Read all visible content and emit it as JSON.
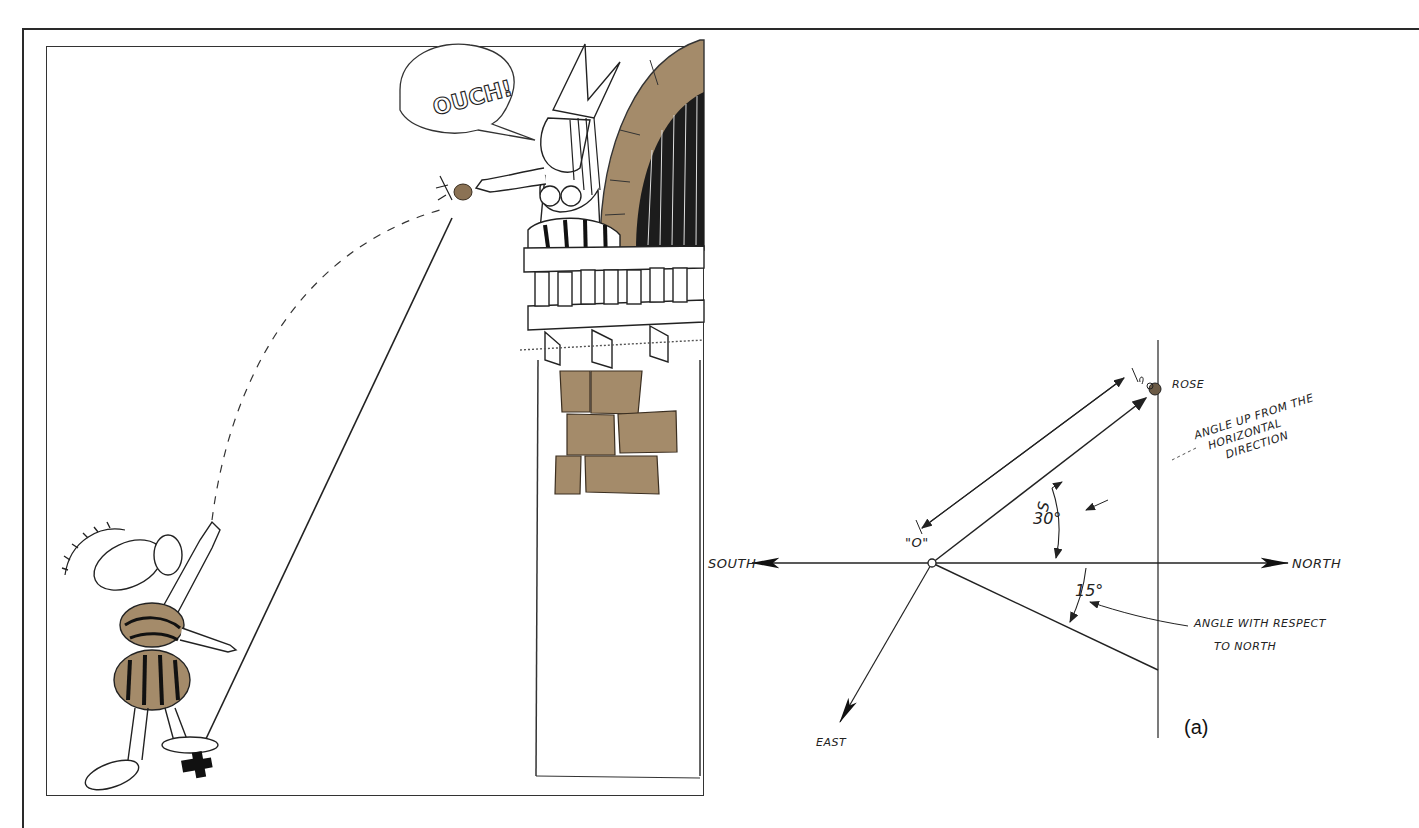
{
  "figure": {
    "panel_label": "(a)",
    "colors": {
      "ink": "#222222",
      "tan": "#a48b6a",
      "background": "#ffffff"
    }
  },
  "cartoon": {
    "speech_bubble": "OUCH!",
    "characters": [
      "thrower-with-feathered-hat",
      "woman-on-balcony"
    ],
    "objects": [
      "rose",
      "balcony",
      "brick-tower",
      "x-mark-origin"
    ]
  },
  "vector_diagram": {
    "directions": {
      "north": "NORTH",
      "south": "SOUTH",
      "east": "EAST"
    },
    "origin_label": "\"O\"",
    "vector_label": "S",
    "target_label": "ROSE",
    "angles": {
      "elevation": "30°",
      "azimuth": "15°"
    },
    "annotations": {
      "elevation_line1": "ANGLE UP FROM THE",
      "elevation_line2": "HORIZONTAL",
      "elevation_line3": "DIRECTION",
      "azimuth_line1": "ANGLE WITH RESPECT",
      "azimuth_line2": "TO NORTH"
    }
  }
}
